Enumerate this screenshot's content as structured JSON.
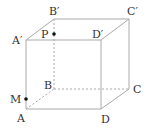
{
  "diagram": {
    "type": "cube",
    "vertices": {
      "A": {
        "label": "A",
        "x": 26,
        "y": 109
      },
      "B": {
        "label": "B",
        "x": 54,
        "y": 89
      },
      "C": {
        "label": "C",
        "x": 129,
        "y": 89
      },
      "D": {
        "label": "D",
        "x": 101,
        "y": 109
      },
      "A1": {
        "label": "A′",
        "x": 26,
        "y": 40
      },
      "B1": {
        "label": "B′",
        "x": 54,
        "y": 19
      },
      "C1": {
        "label": "C′",
        "x": 129,
        "y": 19
      },
      "D1": {
        "label": "D′",
        "x": 101,
        "y": 40
      }
    },
    "points": {
      "P": {
        "label": "P",
        "on_edge": "BB′"
      },
      "M": {
        "label": "M",
        "on_edge": "AA′"
      }
    },
    "hidden_edges": [
      "AB",
      "BC",
      "BB′"
    ],
    "colors": {
      "edge": "#aaaaaa",
      "point": "#111111",
      "label": "#333333"
    }
  }
}
